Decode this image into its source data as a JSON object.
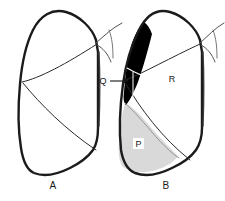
{
  "figure": {
    "background_color": "#ffffff",
    "ink_color": "#1b1b1b",
    "panels": [
      {
        "id": "A",
        "caption": "A",
        "description": "plain lateral lung outline with fissure lines",
        "caption_x": 53,
        "caption_y": 189
      },
      {
        "id": "B",
        "caption": "B",
        "description": "lateral lung outline with shaded regions",
        "caption_x": 166,
        "caption_y": 189
      }
    ],
    "regions": [
      {
        "key": "Q",
        "label": "Q",
        "fill": "#000000",
        "panel": "B",
        "label_x": 103,
        "label_y": 84,
        "has_leader_line": true,
        "leader_from_x": 110,
        "leader_from_y": 81,
        "leader_to_x": 128,
        "leader_to_y": 81
      },
      {
        "key": "P",
        "label": "P",
        "fill": "#d9d9d9",
        "panel": "B",
        "label_x": 138,
        "label_y": 146,
        "has_leader_line": false
      },
      {
        "key": "R",
        "label": "R",
        "fill": "#ffffff",
        "panel": "B",
        "label_x": 172,
        "label_y": 82,
        "has_leader_line": false
      }
    ]
  }
}
